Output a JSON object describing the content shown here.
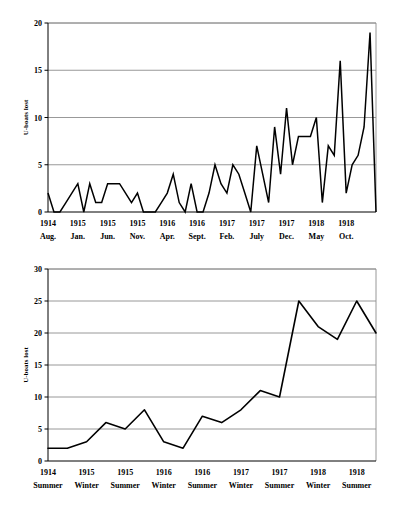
{
  "colors": {
    "line": "#000000",
    "grid": "#8d8d8d",
    "axis": "#000000",
    "background": "#ffffff"
  },
  "figures": [
    {
      "id": "monthly-u-boat-losses",
      "ylabel": "U-boats lost"
    },
    {
      "id": "seasonal-u-boat-losses",
      "ylabel": "U-boats lost"
    }
  ],
  "chart_data": [
    {
      "type": "line",
      "title": "",
      "xlabel": "",
      "ylabel": "U-boats lost",
      "ylim": [
        0,
        20
      ],
      "yticks": [
        0,
        5,
        10,
        15,
        20
      ],
      "ytick_labels": [
        "0",
        "5",
        "10",
        "15",
        "20"
      ],
      "grid": true,
      "legend": "none",
      "xtick_labels": [
        {
          "year": "1914",
          "month": "Aug."
        },
        {
          "year": "1915",
          "month": "Jan."
        },
        {
          "year": "1915",
          "month": "Jun."
        },
        {
          "year": "1915",
          "month": "Nov."
        },
        {
          "year": "1916",
          "month": "Apr."
        },
        {
          "year": "1916",
          "month": "Sept."
        },
        {
          "year": "1917",
          "month": "Feb."
        },
        {
          "year": "1917",
          "month": "July"
        },
        {
          "year": "1917",
          "month": "Dec."
        },
        {
          "year": "1918",
          "month": "May"
        },
        {
          "year": "1918",
          "month": "Oct."
        }
      ],
      "xtick_indices": [
        0,
        5,
        10,
        15,
        20,
        25,
        30,
        35,
        40,
        45,
        50
      ],
      "x": [
        0,
        1,
        2,
        3,
        4,
        5,
        6,
        7,
        8,
        9,
        10,
        11,
        12,
        13,
        14,
        15,
        16,
        17,
        18,
        19,
        20,
        21,
        22,
        23,
        24,
        25,
        26,
        27,
        28,
        29,
        30,
        31,
        32,
        33,
        34,
        35,
        36,
        37,
        38,
        39,
        40,
        41,
        42,
        43,
        44,
        45,
        46,
        47,
        48,
        49,
        50,
        51
      ],
      "values": [
        2,
        0,
        0,
        1,
        2,
        3,
        0,
        3,
        1,
        1,
        3,
        3,
        3,
        2,
        1,
        2,
        0,
        0,
        0,
        1,
        2,
        4,
        1,
        0,
        3,
        0,
        0,
        2,
        5,
        3,
        2,
        5,
        4,
        2,
        0,
        7,
        4,
        1,
        9,
        4,
        11,
        5,
        8,
        8,
        8,
        10,
        1,
        7,
        6,
        16,
        2,
        5,
        6,
        9,
        19,
        0
      ]
    },
    {
      "type": "line",
      "title": "",
      "xlabel": "",
      "ylabel": "U-boats lost",
      "ylim": [
        0,
        30
      ],
      "yticks": [
        0,
        5,
        10,
        15,
        20,
        25,
        30
      ],
      "ytick_labels": [
        "0",
        "5",
        "10",
        "15",
        "20",
        "25",
        "30"
      ],
      "grid": true,
      "legend": "none",
      "xtick_labels": [
        {
          "year": "1914",
          "season": "Summer"
        },
        {
          "year": "1915",
          "season": "Winter"
        },
        {
          "year": "1915",
          "season": "Summer"
        },
        {
          "year": "1916",
          "season": "Winter"
        },
        {
          "year": "1916",
          "season": "Summer"
        },
        {
          "year": "1917",
          "season": "Winter"
        },
        {
          "year": "1917",
          "season": "Summer"
        },
        {
          "year": "1918",
          "season": "Winter"
        },
        {
          "year": "1918",
          "season": "Summer"
        }
      ],
      "xtick_indices": [
        0,
        2,
        4,
        6,
        8,
        10,
        12,
        14,
        16
      ],
      "x": [
        0,
        1,
        2,
        3,
        4,
        5,
        6,
        7,
        8,
        9,
        10,
        11,
        12,
        13,
        14,
        15,
        16,
        17
      ],
      "values": [
        2,
        2,
        3,
        6,
        5,
        8,
        3,
        2,
        7,
        6,
        8,
        11,
        10,
        25,
        21,
        19,
        25,
        20
      ]
    }
  ]
}
